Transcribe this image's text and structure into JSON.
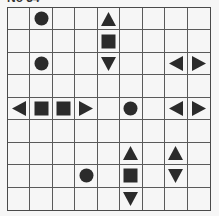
{
  "title": "No 34",
  "puzzle": {
    "type": "battleships",
    "rows": 9,
    "cols": 9,
    "colors": {
      "background": "#f6f6f6",
      "grid_line": "#5a5a5a",
      "shape_fill": "#2b2b2b"
    },
    "cells": [
      [
        "",
        "circle",
        "",
        "",
        "up",
        "",
        "",
        "",
        ""
      ],
      [
        "",
        "",
        "",
        "",
        "square",
        "",
        "",
        "",
        ""
      ],
      [
        "",
        "circle",
        "",
        "",
        "down",
        "",
        "",
        "left",
        "right"
      ],
      [
        "",
        "",
        "",
        "",
        "",
        "",
        "",
        "",
        ""
      ],
      [
        "left",
        "square",
        "square",
        "right",
        "",
        "circle",
        "",
        "left",
        "right"
      ],
      [
        "",
        "",
        "",
        "",
        "",
        "",
        "",
        "",
        ""
      ],
      [
        "",
        "",
        "",
        "",
        "",
        "up",
        "",
        "up",
        ""
      ],
      [
        "",
        "",
        "",
        "circle",
        "",
        "square",
        "",
        "down",
        ""
      ],
      [
        "",
        "",
        "",
        "",
        "",
        "down",
        "",
        "",
        ""
      ]
    ]
  }
}
